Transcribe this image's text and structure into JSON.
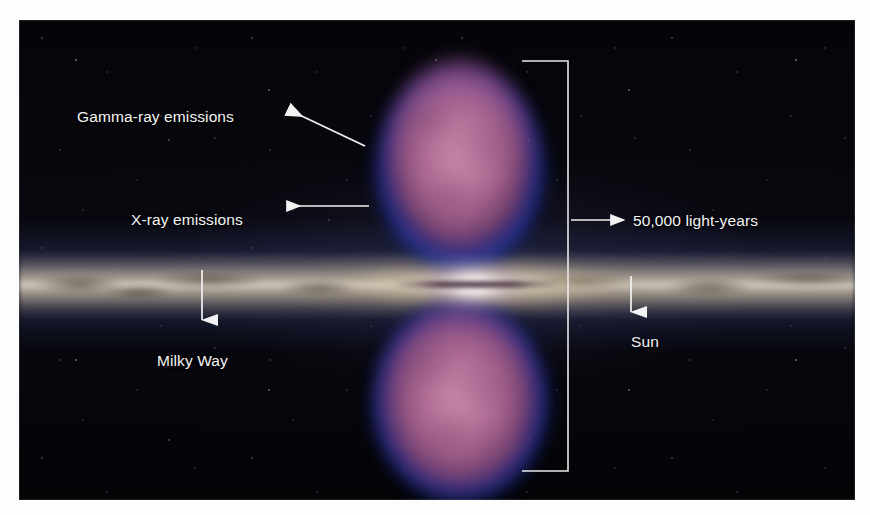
{
  "figure": {
    "background_color": "#050507",
    "page_color": "#ffffff"
  },
  "colors": {
    "gamma_ray_bubble": "#c87ea8",
    "xray_rim": "#2a42d2",
    "galactic_plane": "#e8e0ce",
    "dust_lane": "#2a1a0c",
    "galactic_core": "#ffffff",
    "annotation": "#f4f4f4"
  },
  "annotations": {
    "gamma_ray": {
      "label": "Gamma-ray emissions",
      "arrow": "diagonal-up-left",
      "points_to": "upper gamma-ray bubble"
    },
    "xray": {
      "label": "X-ray emissions",
      "arrow": "horizontal-left",
      "points_to": "blue rim of upper bubble"
    },
    "milky_way": {
      "label": "Milky Way",
      "arrow": "vertical-down",
      "points_to": "galactic plane"
    },
    "sun": {
      "label": "Sun",
      "arrow": "vertical-down",
      "points_to": "position of the Sun in the galactic disk"
    },
    "distance": {
      "label": "50,000 light-years",
      "arrow": "horizontal-right",
      "points_to": "measurement bracket spanning both bubbles"
    }
  },
  "features": {
    "upper_bubble": "gamma-ray bubble",
    "lower_bubble": "gamma-ray bubble",
    "plane": "Milky Way galactic plane",
    "core": "galactic center"
  }
}
